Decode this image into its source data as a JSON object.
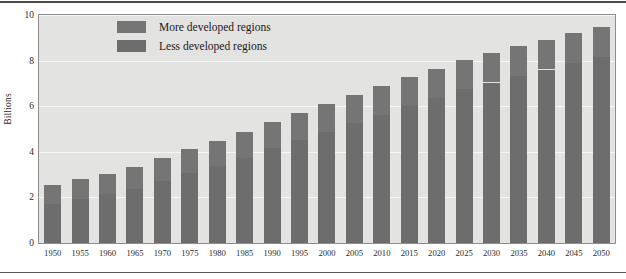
{
  "figure": {
    "ylabel": "Billions",
    "has_top_rule": true,
    "has_bottom_rule": true,
    "plot_background": "#e3e3e1",
    "gridline_color": "#f6f6f4",
    "frame_color": "#8d8d8d"
  },
  "legend": {
    "position": "top-left-inside",
    "items": [
      {
        "label": "More developed regions",
        "color": "#757575",
        "icon": "legend-swatch-icon"
      },
      {
        "label": "Less developed regions",
        "color": "#6d6d6d",
        "icon": "legend-swatch-icon"
      }
    ]
  },
  "chart_data": {
    "type": "bar",
    "stacked": true,
    "title": "",
    "subtitle": "",
    "xlabel": "",
    "ylabel": "Billions",
    "ylim": [
      0,
      10
    ],
    "yticks": [
      0,
      2,
      4,
      6,
      8,
      10
    ],
    "ytick_labels": [
      "0",
      "2",
      "4",
      "6",
      "8",
      "10"
    ],
    "grid": true,
    "grid_axis": "y",
    "legend_position": "upper left",
    "categories": [
      "1950",
      "1955",
      "1960",
      "1965",
      "1970",
      "1975",
      "1980",
      "1985",
      "1990",
      "1995",
      "2000",
      "2005",
      "2010",
      "2015",
      "2020",
      "2025",
      "2030",
      "2035",
      "2040",
      "2045",
      "2050"
    ],
    "series": [
      {
        "name": "Less developed regions",
        "color": "#6d6d6d",
        "values": [
          1.72,
          1.95,
          2.13,
          2.38,
          2.72,
          3.06,
          3.39,
          3.75,
          4.15,
          4.52,
          4.89,
          5.26,
          5.63,
          6.01,
          6.38,
          6.74,
          7.04,
          7.33,
          7.61,
          7.89,
          8.15
        ]
      },
      {
        "name": "More developed regions",
        "color": "#757575",
        "values": [
          0.81,
          0.86,
          0.91,
          0.95,
          1.0,
          1.05,
          1.08,
          1.11,
          1.14,
          1.17,
          1.19,
          1.22,
          1.24,
          1.26,
          1.27,
          1.29,
          1.29,
          1.3,
          1.31,
          1.32,
          1.32
        ]
      }
    ],
    "totals": [
      2.53,
      2.81,
      3.04,
      3.33,
      3.72,
      4.11,
      4.47,
      4.86,
      5.29,
      5.69,
      6.08,
      6.48,
      6.87,
      7.27,
      7.65,
      8.03,
      8.33,
      8.63,
      8.92,
      9.21,
      9.47
    ]
  }
}
